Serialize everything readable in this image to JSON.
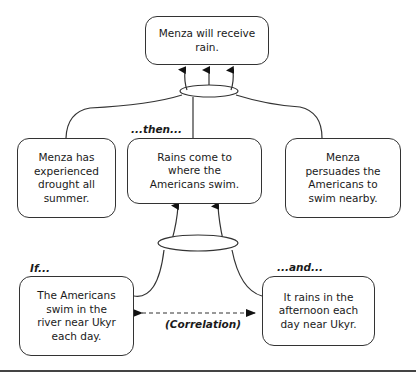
{
  "nodes": {
    "conclusion": "Menza will receive rain.",
    "drought": "Menza has experienced drought all summer.",
    "rains_come": "Rains come to where the Americans swim.",
    "persuades": "Menza persuades the Americans to swim nearby.",
    "americans_swim": "The Americans swim in the river near Ukyr each day.",
    "rains_ukyr": "It rains in the afternoon each day near Ukyr."
  },
  "labels": {
    "then": "...then...",
    "if": "If...",
    "and": "...and...",
    "correlation": "(Correlation)"
  },
  "colors": {
    "stroke": "#333333",
    "background": "#ffffff"
  }
}
